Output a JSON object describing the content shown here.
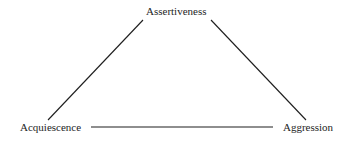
{
  "diagram": {
    "type": "triangle",
    "nodes": [
      {
        "id": "top",
        "label": "Assertiveness",
        "position": "top-center"
      },
      {
        "id": "left",
        "label": "Acquiescence",
        "position": "bottom-left"
      },
      {
        "id": "right",
        "label": "Aggression",
        "position": "bottom-right"
      }
    ],
    "edges": [
      {
        "from": "top",
        "to": "left"
      },
      {
        "from": "top",
        "to": "right"
      },
      {
        "from": "left",
        "to": "right"
      }
    ],
    "line_color": "#1e1e1e"
  }
}
